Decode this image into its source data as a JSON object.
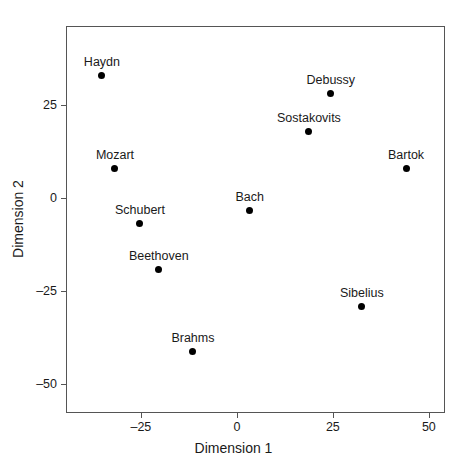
{
  "chart_data": {
    "type": "scatter",
    "title": "",
    "xlabel": "Dimension 1",
    "ylabel": "Dimension 2",
    "xlim": [
      -44.5,
      54.2
    ],
    "ylim": [
      -57.8,
      46.2
    ],
    "xticks": [
      -25,
      0,
      25,
      50
    ],
    "xticklabels": [
      "–25",
      "0",
      "25",
      "50"
    ],
    "yticks": [
      25,
      0,
      -25,
      -50
    ],
    "yticklabels": [
      "25",
      "0",
      "–25",
      "–50"
    ],
    "grid": false,
    "legend": null,
    "marker": "filled-circle",
    "marker_color": "#000000",
    "points": [
      {
        "label": "Haydn",
        "x": -35.4,
        "y": 33.3
      },
      {
        "label": "Mozart",
        "x": -32.0,
        "y": 8.1
      },
      {
        "label": "Schubert",
        "x": -25.5,
        "y": -6.5
      },
      {
        "label": "Beethoven",
        "x": -20.6,
        "y": -19.1
      },
      {
        "label": "Brahms",
        "x": -11.7,
        "y": -40.9
      },
      {
        "label": "Bach",
        "x": 3.1,
        "y": -3.0
      },
      {
        "label": "Sostakovits",
        "x": 18.5,
        "y": 18.0
      },
      {
        "label": "Debussy",
        "x": 24.2,
        "y": 28.2
      },
      {
        "label": "Sibelius",
        "x": 32.3,
        "y": -29.0
      },
      {
        "label": "Bartok",
        "x": 43.8,
        "y": 8.3
      }
    ]
  }
}
